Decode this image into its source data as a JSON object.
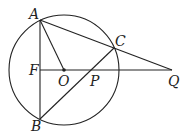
{
  "diagram": {
    "type": "geometry",
    "circle": {
      "center": "O",
      "cx": 64,
      "cy": 70,
      "r": 55
    },
    "points": [
      {
        "name": "A",
        "label": "A",
        "x": 40,
        "y": 20
      },
      {
        "name": "B",
        "label": "B",
        "x": 40,
        "y": 119
      },
      {
        "name": "C",
        "label": "C",
        "x": 114,
        "y": 48
      },
      {
        "name": "F",
        "label": "F",
        "x": 40,
        "y": 70
      },
      {
        "name": "O",
        "label": "O",
        "x": 64,
        "y": 70
      },
      {
        "name": "P",
        "label": "P",
        "x": 90,
        "y": 70
      },
      {
        "name": "Q",
        "label": "Q",
        "x": 172,
        "y": 70
      }
    ],
    "segments": [
      "AB",
      "AO",
      "AQ",
      "BC",
      "FQ"
    ]
  }
}
